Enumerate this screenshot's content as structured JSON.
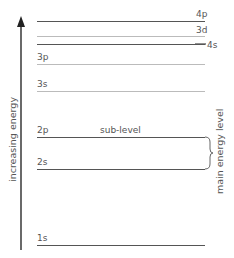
{
  "diagram": {
    "axis": {
      "label": "increasing energy",
      "direction": "up"
    },
    "levels": [
      {
        "name": "4p",
        "y": 21,
        "style": "dark",
        "label_pos": "right-above"
      },
      {
        "name": "3d",
        "y": 36,
        "style": "light",
        "label_pos": "right-above"
      },
      {
        "name": "4s",
        "y": 44,
        "style": "dark",
        "label_pos": "right-end"
      },
      {
        "name": "3p",
        "y": 64,
        "style": "light",
        "label_pos": "left-above"
      },
      {
        "name": "3s",
        "y": 91,
        "style": "light",
        "label_pos": "left-above"
      },
      {
        "name": "2p",
        "y": 137,
        "style": "dark",
        "label_pos": "left-above"
      },
      {
        "name": "2s",
        "y": 169,
        "style": "dark",
        "label_pos": "left-above"
      },
      {
        "name": "1s",
        "y": 245,
        "style": "dark",
        "label_pos": "left-above"
      }
    ],
    "annotations": {
      "sub_level": "sub-level",
      "main_energy_level": "main energy level"
    },
    "colors": {
      "dark_line": "#555555",
      "light_line": "#bbbbbb",
      "text": "#555555"
    }
  }
}
